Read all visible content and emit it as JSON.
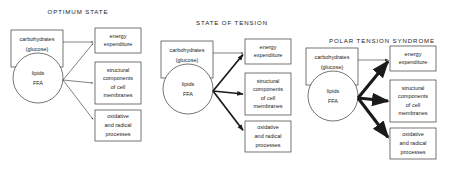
{
  "figure": {
    "background_color": "#ffffff",
    "line_color": "#1a1a1a",
    "box_stroke_color": "#3a3a3a"
  },
  "panels": [
    {
      "id": "optimum-state",
      "title": "OPTIMUM  STATE",
      "title_x": 78,
      "title_y": 14,
      "origin_x": 0,
      "arrow_weight": "thin",
      "arrow_stroke_width": 0.55,
      "arrow_head_scale": 1.0,
      "source": {
        "rect_label_line1": "carbohydrates",
        "rect_label_line2": "(glucose)",
        "circle_label_line1": "lipids",
        "circle_label_line2": "FFA"
      },
      "targets": [
        {
          "lines": [
            "energy",
            "expenditure"
          ]
        },
        {
          "lines": [
            "structural",
            "components",
            "of  cell",
            "membranes"
          ]
        },
        {
          "lines": [
            "oxidative",
            "and  radical",
            "processes"
          ]
        }
      ]
    },
    {
      "id": "state-of-tension",
      "title": "STATE  OF  TENSION",
      "title_x": 232,
      "title_y": 25,
      "origin_x": 150,
      "arrow_weight": "medium",
      "arrow_stroke_width": 1.7,
      "arrow_head_scale": 1.9,
      "source": {
        "rect_label_line1": "carbohydrates",
        "rect_label_line2": "(glucose)",
        "circle_label_line1": "lipids",
        "circle_label_line2": "FFA"
      },
      "targets": [
        {
          "lines": [
            "energy",
            "expenditure"
          ]
        },
        {
          "lines": [
            "structural",
            "components",
            "of  cell",
            "membranes"
          ]
        },
        {
          "lines": [
            "oxidative",
            "and  radical",
            "processes"
          ]
        }
      ]
    },
    {
      "id": "polar-tension-syndrome",
      "title": "POLAR  TENSION  SYNDROME",
      "title_x": 382,
      "title_y": 43,
      "origin_x": 295,
      "arrow_weight": "thick",
      "arrow_stroke_width": 3.1,
      "arrow_head_scale": 2.9,
      "source": {
        "rect_label_line1": "carbohydrates",
        "rect_label_line2": "(glucose)",
        "circle_label_line1": "lipids",
        "circle_label_line2": "FFA"
      },
      "targets": [
        {
          "lines": [
            "energy",
            "expenditure"
          ]
        },
        {
          "lines": [
            "structural",
            "components",
            "of  cell",
            "membranes"
          ]
        },
        {
          "lines": [
            "oxidative",
            "and  radical",
            "processes"
          ]
        }
      ]
    }
  ],
  "geometry": {
    "panel_vertical_offsets": [
      0,
      11,
      18
    ],
    "source_rect": {
      "x": 11,
      "y": 30,
      "w": 52,
      "h": 37
    },
    "source_circle": {
      "cx": 38,
      "cy": 78,
      "r": 25
    },
    "target_boxes": [
      {
        "x": 95,
        "y": 28,
        "w": 46,
        "h": 25
      },
      {
        "x": 95,
        "y": 62,
        "w": 46,
        "h": 42
      },
      {
        "x": 95,
        "y": 110,
        "w": 46,
        "h": 31
      }
    ],
    "hub": {
      "x": 63,
      "y": 80
    }
  }
}
